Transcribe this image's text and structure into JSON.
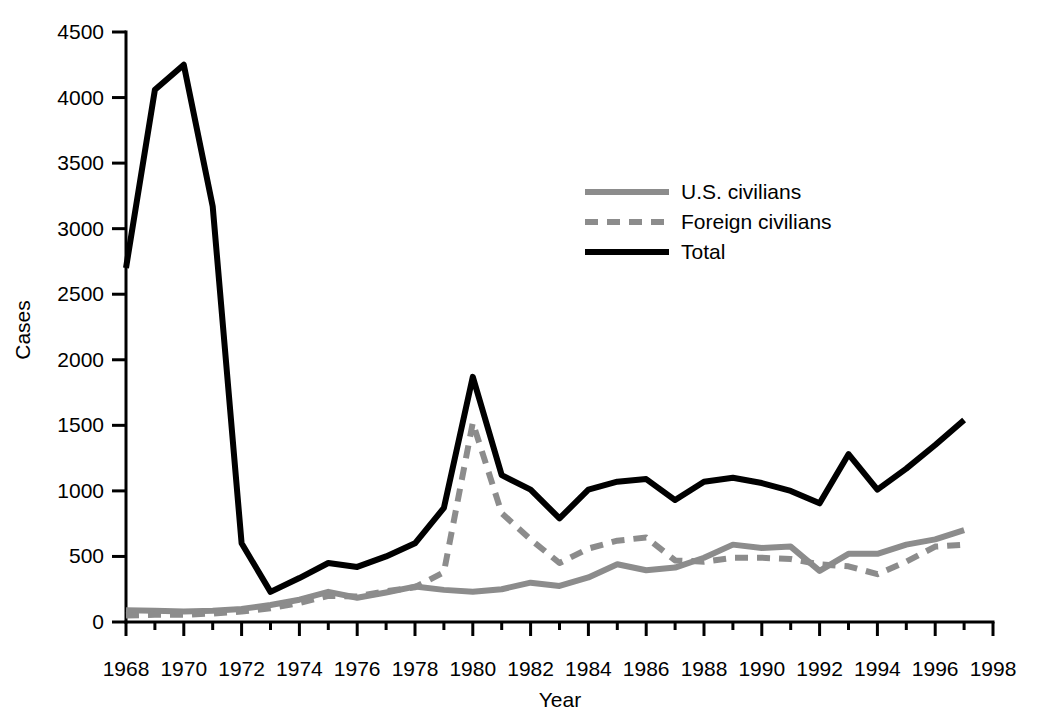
{
  "chart_data": {
    "type": "line",
    "title": "",
    "xlabel": "Year",
    "ylabel": "Cases",
    "xlim": [
      1968,
      1998
    ],
    "ylim": [
      0,
      4500
    ],
    "grid": false,
    "legend_position": "upper-center",
    "x_ticks": [
      1968,
      1970,
      1972,
      1974,
      1976,
      1978,
      1980,
      1982,
      1984,
      1986,
      1988,
      1990,
      1992,
      1994,
      1996,
      1998
    ],
    "x_tick_labels": [
      "1968",
      "1970",
      "1972",
      "1974",
      "1976",
      "1978",
      "1980",
      "1982",
      "1984",
      "1986",
      "1988",
      "1990",
      "1992",
      "1994",
      "1996",
      "1998"
    ],
    "x_minor_ticks": [
      1969,
      1971,
      1973,
      1975,
      1977,
      1979,
      1981,
      1983,
      1985,
      1987,
      1989,
      1991,
      1993,
      1995,
      1997
    ],
    "y_ticks": [
      0,
      500,
      1000,
      1500,
      2000,
      2500,
      3000,
      3500,
      4000,
      4500
    ],
    "y_tick_labels": [
      "0",
      "500",
      "1000",
      "1500",
      "2000",
      "2500",
      "3000",
      "3500",
      "4000",
      "4500"
    ],
    "x": [
      1968,
      1969,
      1970,
      1971,
      1972,
      1973,
      1974,
      1975,
      1976,
      1977,
      1978,
      1979,
      1980,
      1981,
      1982,
      1983,
      1984,
      1985,
      1986,
      1987,
      1988,
      1989,
      1990,
      1991,
      1992,
      1993,
      1994,
      1995,
      1996,
      1997
    ],
    "series": [
      {
        "name": "U.S. civilians",
        "color": "#8c8c8c",
        "style": "solid",
        "width": 6,
        "values": [
          90,
          85,
          80,
          85,
          100,
          130,
          170,
          230,
          185,
          225,
          270,
          245,
          230,
          250,
          300,
          275,
          340,
          440,
          395,
          415,
          490,
          590,
          565,
          575,
          390,
          520,
          520,
          590,
          630,
          700
        ]
      },
      {
        "name": "Foreign civilians",
        "color": "#8c8c8c",
        "style": "dashed",
        "width": 6,
        "values": [
          50,
          55,
          55,
          65,
          80,
          105,
          145,
          200,
          195,
          235,
          265,
          380,
          1520,
          830,
          630,
          450,
          560,
          620,
          645,
          470,
          460,
          490,
          490,
          480,
          440,
          425,
          365,
          460,
          575,
          590
        ]
      },
      {
        "name": "Total",
        "color": "#000000",
        "style": "solid",
        "width": 6,
        "values": [
          2700,
          4060,
          4250,
          3170,
          600,
          230,
          335,
          450,
          420,
          500,
          600,
          870,
          1870,
          1120,
          1010,
          790,
          1010,
          1070,
          1090,
          930,
          1070,
          1100,
          1060,
          1000,
          905,
          1280,
          1010,
          1170,
          1350,
          1540
        ]
      }
    ],
    "legend": [
      {
        "label": "U.S. civilians",
        "color": "#8c8c8c",
        "style": "solid"
      },
      {
        "label": "Foreign civilians",
        "color": "#8c8c8c",
        "style": "dashed"
      },
      {
        "label": "Total",
        "color": "#000000",
        "style": "solid"
      }
    ]
  },
  "plot_geometry": {
    "x0_px": 126,
    "x1_px": 993,
    "y0_px": 622,
    "y1_px": 32,
    "x_axis_y_px": 622,
    "y_axis_x_px": 126,
    "major_tick_len": 14,
    "minor_tick_len": 8,
    "x_label_y_px": 662,
    "x_title_pos": [
      560,
      707
    ],
    "y_title_pos": [
      30,
      330
    ],
    "legend_x_px": 585,
    "legend_y_px": 192,
    "legend_line_len": 84,
    "legend_row_gap": 30,
    "legend_text_gap": 12
  }
}
